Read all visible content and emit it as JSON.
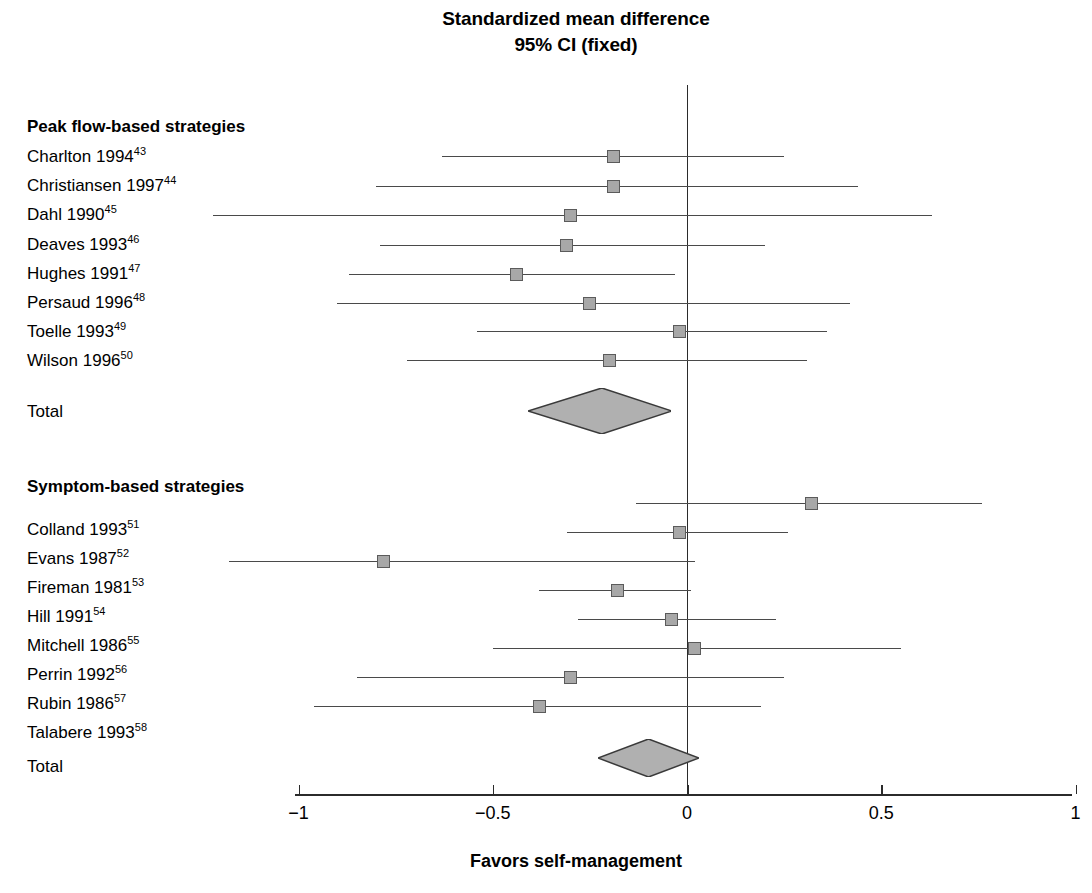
{
  "title": {
    "line1": "Standardized mean difference",
    "line2": "95% CI (fixed)"
  },
  "axis": {
    "caption": "Favors self-management",
    "tick_labels": [
      "−1",
      "−0.5",
      "0",
      "0.5",
      "1"
    ],
    "tick_values": [
      -1,
      -0.5,
      0,
      0.5,
      1
    ],
    "xmin": -1,
    "xmax": 1,
    "null_value": 0
  },
  "groups": [
    {
      "heading": "Peak flow-based strategies",
      "total_label": "Total"
    },
    {
      "heading": "Symptom-based strategies",
      "total_label": "Total"
    }
  ],
  "labels": {
    "charlton": "Charlton 1994",
    "charlton_ref": "43",
    "christiansen": "Christiansen 1997",
    "christiansen_ref": "44",
    "dahl": "Dahl 1990",
    "dahl_ref": "45",
    "deaves": "Deaves 1993",
    "deaves_ref": "46",
    "hughes": "Hughes 1991",
    "hughes_ref": "47",
    "persaud": "Persaud 1996",
    "persaud_ref": "48",
    "toelle": "Toelle 1993",
    "toelle_ref": "49",
    "wilson": "Wilson 1996",
    "wilson_ref": "50",
    "colland": "Colland 1993",
    "colland_ref": "51",
    "evans": "Evans 1987",
    "evans_ref": "52",
    "fireman": "Fireman 1981",
    "fireman_ref": "53",
    "hill": "Hill 1991",
    "hill_ref": "54",
    "mitchell": "Mitchell 1986",
    "mitchell_ref": "55",
    "perrin": "Perrin 1992",
    "perrin_ref": "56",
    "rubin": "Rubin 1986",
    "rubin_ref": "57",
    "talabere": "Talabere 1993",
    "talabere_ref": "58",
    "total1": "Total",
    "total2": "Total"
  },
  "colors": {
    "marker_fill": "#a8a8a8",
    "marker_edge": "#5b5b5b",
    "diamond_fill": "#b0b0b0",
    "diamond_edge": "#3a3a3a",
    "line": "#4a4a4a",
    "axis": "#2b2b2b"
  },
  "chart_data": {
    "type": "forest",
    "title": "Standardized mean difference 95% CI (fixed)",
    "xlabel": "Favors self-management",
    "ylabel": "",
    "xlim": [
      -1,
      1
    ],
    "xticks": [
      -1,
      -0.5,
      0,
      0.5,
      1
    ],
    "null_line": 0,
    "effect_measure": "Standardized mean difference",
    "model": "fixed",
    "ci_level": "95%",
    "grid": false,
    "legend": "none",
    "groups": [
      {
        "name": "Peak flow-based strategies",
        "studies": [
          {
            "label": "Charlton 1994",
            "ref": 43,
            "estimate": -0.19,
            "ci_low": -0.63,
            "ci_high": 0.25
          },
          {
            "label": "Christiansen 1997",
            "ref": 44,
            "estimate": -0.19,
            "ci_low": -0.8,
            "ci_high": 0.44
          },
          {
            "label": "Dahl 1990",
            "ref": 45,
            "estimate": -0.3,
            "ci_low": -1.22,
            "ci_high": 0.63
          },
          {
            "label": "Deaves 1993",
            "ref": 46,
            "estimate": -0.31,
            "ci_low": -0.79,
            "ci_high": 0.2
          },
          {
            "label": "Hughes 1991",
            "ref": 47,
            "estimate": -0.44,
            "ci_low": -0.87,
            "ci_high": -0.03
          },
          {
            "label": "Persaud 1996",
            "ref": 48,
            "estimate": -0.25,
            "ci_low": -0.9,
            "ci_high": 0.42
          },
          {
            "label": "Toelle 1993",
            "ref": 49,
            "estimate": -0.02,
            "ci_low": -0.54,
            "ci_high": 0.36
          },
          {
            "label": "Wilson 1996",
            "ref": 50,
            "estimate": -0.2,
            "ci_low": -0.72,
            "ci_high": 0.31
          }
        ],
        "summary": {
          "label": "Total",
          "estimate": -0.22,
          "ci_low": -0.41,
          "ci_high": -0.04
        }
      },
      {
        "name": "Symptom-based strategies",
        "studies": [
          {
            "label": "Colland 1993",
            "ref": 51,
            "estimate": 0.32,
            "ci_low": -0.13,
            "ci_high": 0.76
          },
          {
            "label": "Evans 1987",
            "ref": 52,
            "estimate": -0.02,
            "ci_low": -0.31,
            "ci_high": 0.26
          },
          {
            "label": "Fireman 1981",
            "ref": 53,
            "estimate": -0.78,
            "ci_low": -1.18,
            "ci_high": 0.02
          },
          {
            "label": "Hill 1991",
            "ref": 54,
            "estimate": -0.18,
            "ci_low": -0.38,
            "ci_high": 0.01
          },
          {
            "label": "Mitchell 1986",
            "ref": 55,
            "estimate": -0.04,
            "ci_low": -0.28,
            "ci_high": 0.23
          },
          {
            "label": "Perrin 1992",
            "ref": 56,
            "estimate": 0.02,
            "ci_low": -0.5,
            "ci_high": 0.55
          },
          {
            "label": "Rubin 1986",
            "ref": 57,
            "estimate": -0.3,
            "ci_low": -0.85,
            "ci_high": 0.25
          },
          {
            "label": "Talabere 1993",
            "ref": 58,
            "estimate": -0.38,
            "ci_low": -0.96,
            "ci_high": 0.19
          }
        ],
        "summary": {
          "label": "Total",
          "estimate": -0.1,
          "ci_low": -0.23,
          "ci_high": 0.03
        }
      }
    ]
  },
  "geometry": {
    "x_left_px": 295,
    "x_zero_px": 687,
    "x_right_px": 1072,
    "axis_y_px": 794,
    "zero_line_top_px": 85,
    "zero_line_bottom_px": 794,
    "rows": {
      "heading1_y": 126,
      "charlton_y": 156,
      "christiansen_y": 186,
      "dahl_y": 215,
      "deaves_y": 245,
      "hughes_y": 274,
      "persaud_y": 303,
      "toelle_y": 331,
      "wilson_y": 360,
      "total1_y": 411,
      "heading2_y": 487,
      "colland_y": 503,
      "evans_y": 532,
      "fireman_y": 561,
      "hill_y": 590,
      "mitchell_y": 619,
      "perrin_y": 648,
      "rubin_y": 677,
      "talabere_y": 706,
      "total2_y": 758
    }
  }
}
